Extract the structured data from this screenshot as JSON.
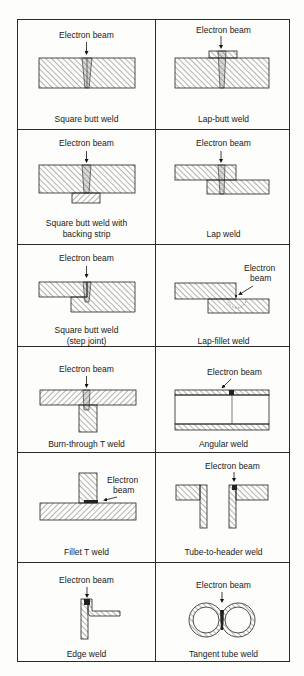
{
  "figure": {
    "beam_label": "Electron beam",
    "cells": [
      {
        "id": "square-butt-weld",
        "caption": "Square butt weld",
        "beam": "Electron beam"
      },
      {
        "id": "lap-butt-weld",
        "caption": "Lap-butt weld",
        "beam": "Electron beam"
      },
      {
        "id": "square-butt-weld-backing-strip",
        "caption_line1": "Square butt weld with",
        "caption_line2": "backing strip",
        "beam": "Electron beam"
      },
      {
        "id": "lap-weld",
        "caption": "Lap weld",
        "beam": "Electron beam"
      },
      {
        "id": "square-butt-weld-step-joint",
        "caption_line1": "Square butt weld",
        "caption_line2": "(step joint)",
        "beam": "Electron beam"
      },
      {
        "id": "lap-fillet-weld",
        "caption": "Lap-fillet weld",
        "beam_line1": "Electron",
        "beam_line2": "beam"
      },
      {
        "id": "burn-through-t-weld",
        "caption": "Burn-through T weld",
        "beam": "Electron beam"
      },
      {
        "id": "angular-weld",
        "caption": "Angular weld",
        "beam": "Electron beam"
      },
      {
        "id": "fillet-t-weld",
        "caption": "Fillet T weld",
        "beam_line1": "Electron",
        "beam_line2": "beam"
      },
      {
        "id": "tube-to-header-weld",
        "caption": "Tube-to-header weld",
        "beam": "Electron beam"
      },
      {
        "id": "edge-weld",
        "caption": "Edge weld",
        "beam": "Electron beam"
      },
      {
        "id": "tangent-tube-weld",
        "caption": "Tangent tube weld",
        "beam": "Electron beam"
      }
    ]
  }
}
